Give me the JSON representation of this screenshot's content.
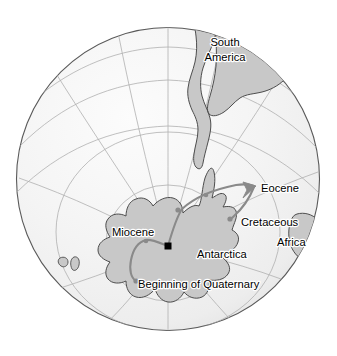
{
  "figure": {
    "type": "map-diagram",
    "projection": "orthographic-south-polar",
    "background_color": "#ffffff",
    "globe": {
      "outline_color": "#4d4d4d",
      "fill_color": "#f2f2f2",
      "graticule_color": "#b3b3b3",
      "center_x": 168,
      "center_y": 179,
      "radius": 152
    },
    "landmass_style": {
      "fill_color": "#c8c8c8",
      "outline_color": "#4d4d4d"
    },
    "path_style": {
      "line_color": "#8c8c8c",
      "marker_color": "#8c8c8c",
      "arrow_color": "#8c8c8c"
    },
    "pole_marker": {
      "shape": "square",
      "color": "#000000",
      "x": 168,
      "y": 246
    }
  },
  "landmasses": [
    {
      "id": "south-america",
      "label": "South\nAmerica",
      "label_line1": "South",
      "label_line2": "America",
      "label_x": 243,
      "label_y": 47
    },
    {
      "id": "antarctica",
      "label": "Antarctica",
      "label_x": 222,
      "label_y": 255
    },
    {
      "id": "africa",
      "label": "Africa",
      "label_x": 300,
      "label_y": 246
    },
    {
      "id": "australia",
      "label": "",
      "label_x": 0,
      "label_y": 0
    },
    {
      "id": "new-zealand",
      "label": "",
      "label_x": 0,
      "label_y": 0
    }
  ],
  "polar_wander_path": {
    "name": "Apparent polar wander path",
    "direction": "toward Eocene (arrow)",
    "stops": [
      {
        "id": "cretaceous",
        "label": "Cretaceous",
        "marker_x": 230,
        "marker_y": 219,
        "label_x": 242,
        "label_y": 233
      },
      {
        "id": "eocene",
        "label": "Eocene",
        "marker_x": 253,
        "marker_y": 187,
        "label_x": 259,
        "label_y": 188
      },
      {
        "id": "miocene",
        "label": "Miocene",
        "marker_x": 178,
        "marker_y": 209,
        "label_x": 115,
        "label_y": 233
      },
      {
        "id": "beginning-of-quaternary",
        "label": "Beginning of Quaternary",
        "marker_x": 136,
        "marker_y": 281,
        "label_x": 139,
        "label_y": 287
      }
    ]
  },
  "labels": {
    "south_america_line1": "South",
    "south_america_line2": "America",
    "antarctica": "Antarctica",
    "africa": "Africa",
    "eocene": "Eocene",
    "cretaceous": "Cretaceous",
    "miocene": "Miocene",
    "beginning_of_quaternary": "Beginning of Quaternary"
  }
}
